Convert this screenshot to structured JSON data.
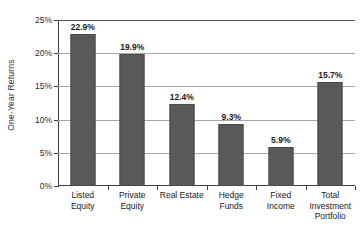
{
  "chart_data": {
    "type": "bar",
    "title": "",
    "xlabel": "",
    "ylabel": "One-Year Returns",
    "categories": [
      "Listed Equity",
      "Private Equity",
      "Real Estate",
      "Hedge Funds",
      "Fixed Income",
      "Total Investment Portfolio"
    ],
    "category_lines": [
      [
        "Listed",
        "Equity"
      ],
      [
        "Private",
        "Equity"
      ],
      [
        "Real Estate"
      ],
      [
        "Hedge",
        "Funds"
      ],
      [
        "Fixed",
        "Income"
      ],
      [
        "Total",
        "Investment",
        "Portfolio"
      ]
    ],
    "values": [
      22.9,
      19.9,
      12.4,
      9.3,
      5.9,
      15.7
    ],
    "value_labels": [
      "22.9%",
      "19.9%",
      "12.4%",
      "9.3%",
      "5.9%",
      "15.7%"
    ],
    "ylim": [
      0,
      25
    ],
    "ytick_values": [
      0,
      5,
      10,
      15,
      20,
      25
    ],
    "ytick_labels": [
      "0%",
      "5%",
      "10%",
      "15%",
      "20%",
      "25%"
    ],
    "grid": true,
    "legend": false,
    "legend_position": "none",
    "series": [
      {
        "name": "One-Year Returns",
        "values": [
          22.9,
          19.9,
          12.4,
          9.3,
          5.9,
          15.7
        ]
      }
    ]
  },
  "style": {
    "bar_color": "#595959",
    "bar_border_color": "#4a4a4a",
    "gridline_color": "#a8a8a8",
    "axis_color": "#3d3d3d",
    "background": "#ffffff",
    "text_color": "#1a1a1a"
  }
}
